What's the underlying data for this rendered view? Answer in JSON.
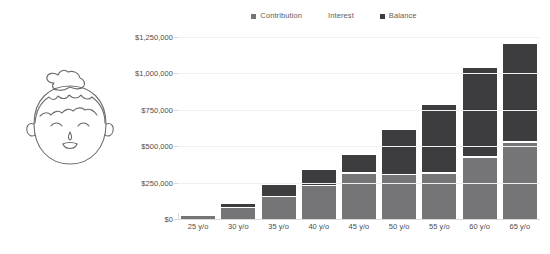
{
  "illustration": {
    "name": "smiling-person-face-line-art",
    "stroke_color": "#6e6e72",
    "alt": "Line drawing of a smiling person with curly hair and a top bun"
  },
  "legend": {
    "position": "top-center",
    "items": [
      {
        "label": "Contribution",
        "color": "#757578",
        "has_swatch": true
      },
      {
        "label": "Interest",
        "color": "#ffffff",
        "has_swatch": false
      },
      {
        "label": "Balance",
        "color": "#3d3d3f",
        "has_swatch": true
      }
    ]
  },
  "chart_data": {
    "type": "bar",
    "stacked": true,
    "title": "",
    "subtitle": "",
    "xlabel": "",
    "ylabel": "",
    "grid": true,
    "legend_position": "top-center",
    "ylim": [
      0,
      1250000
    ],
    "ytick_labels": [
      "$0",
      "$250,000",
      "$500,000",
      "$750,000",
      "$1,000,000",
      "$1,250,000"
    ],
    "ytick_values": [
      0,
      250000,
      500000,
      750000,
      1000000,
      1250000
    ],
    "categories": [
      "25 y/o",
      "30 y/o",
      "35 y/o",
      "40 y/o",
      "45 y/o",
      "50 y/o",
      "55 y/o",
      "60 y/o",
      "65 y/o"
    ],
    "series": [
      {
        "name": "Contribution",
        "color": "#757578",
        "values": [
          20000,
          75000,
          150000,
          225000,
          310000,
          300000,
          310000,
          420000,
          525000
        ]
      },
      {
        "name": "Balance",
        "color": "#3d3d3f",
        "values": [
          0,
          20000,
          75000,
          100000,
          120000,
          300000,
          460000,
          610000,
          665000
        ]
      }
    ],
    "totals": [
      20000,
      95000,
      225000,
      325000,
      430000,
      600000,
      770000,
      1030000,
      1190000
    ]
  },
  "colors": {
    "contribution": "#757578",
    "balance": "#3d3d3f",
    "gridline": "#f0f0f1",
    "axis": "#d9d9db",
    "text": "#4c4c4f",
    "legend_text": "#5e5e61",
    "background": "#ffffff"
  }
}
